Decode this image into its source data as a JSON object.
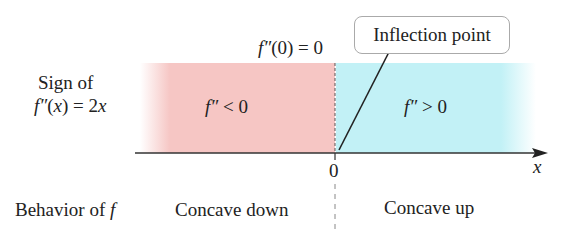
{
  "row_labels": {
    "sign_line1": "Sign of",
    "sign_line2": "f″(x) = 2x",
    "behavior": "Behavior of f"
  },
  "top_label": "f″(0) = 0",
  "callout": "Inflection point",
  "regions": [
    {
      "sign": "f″ < 0",
      "behavior": "Concave down",
      "color": "#f6c6c4"
    },
    {
      "sign": "f″ > 0",
      "behavior": "Concave up",
      "color": "#c2f1f6"
    }
  ],
  "axis": {
    "label": "x",
    "tick": "0"
  }
}
